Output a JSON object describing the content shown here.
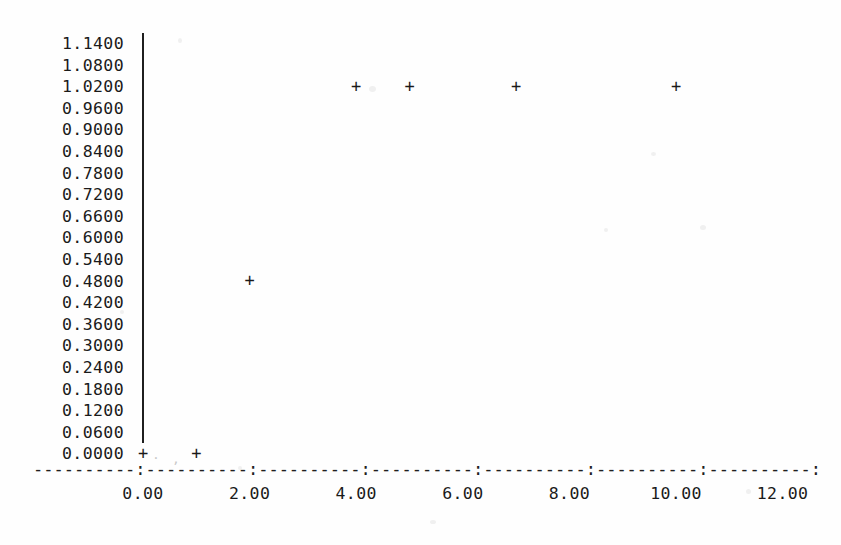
{
  "chart_data": {
    "type": "scatter",
    "title": "",
    "subtitle": "",
    "xlabel": "",
    "ylabel": "",
    "marker": "+",
    "grid": false,
    "legend": null,
    "xlim": [
      0.0,
      12.0
    ],
    "ylim": [
      0.0,
      1.14
    ],
    "x_ticks": [
      0.0,
      2.0,
      4.0,
      6.0,
      8.0,
      10.0,
      12.0
    ],
    "x_tick_labels": [
      "0.00",
      "2.00",
      "4.00",
      "6.00",
      "8.00",
      "10.00",
      "12.00"
    ],
    "y_ticks": [
      1.14,
      1.08,
      1.02,
      0.96,
      0.9,
      0.84,
      0.78,
      0.72,
      0.66,
      0.6,
      0.54,
      0.48,
      0.42,
      0.36,
      0.3,
      0.24,
      0.18,
      0.12,
      0.06,
      0.0
    ],
    "y_tick_labels": [
      "1.1400",
      "1.0800",
      "1.0200",
      "0.9600",
      "0.9000",
      "0.8400",
      "0.7800",
      "0.7200",
      "0.6600",
      "0.6000",
      "0.5400",
      "0.4800",
      "0.4200",
      "0.3600",
      "0.3000",
      "0.2400",
      "0.1800",
      "0.1200",
      "0.0600",
      "0.0000"
    ],
    "points": [
      {
        "x": 0.0,
        "y": 0.0
      },
      {
        "x": 1.0,
        "y": 0.0
      },
      {
        "x": 2.0,
        "y": 0.48
      },
      {
        "x": 4.0,
        "y": 1.02
      },
      {
        "x": 5.0,
        "y": 1.02
      },
      {
        "x": 7.0,
        "y": 1.02
      },
      {
        "x": 10.0,
        "y": 1.02
      }
    ],
    "axis_style": {
      "x_axis_characters": "----------:----------:----------:----------:----------:----------:----------:",
      "y_axis_line": "solid vertical rule",
      "tick_character": ":"
    },
    "colors": {
      "ink": "#1a1a1a",
      "axis": "#1f1f1f",
      "background": "#fefefe"
    }
  }
}
